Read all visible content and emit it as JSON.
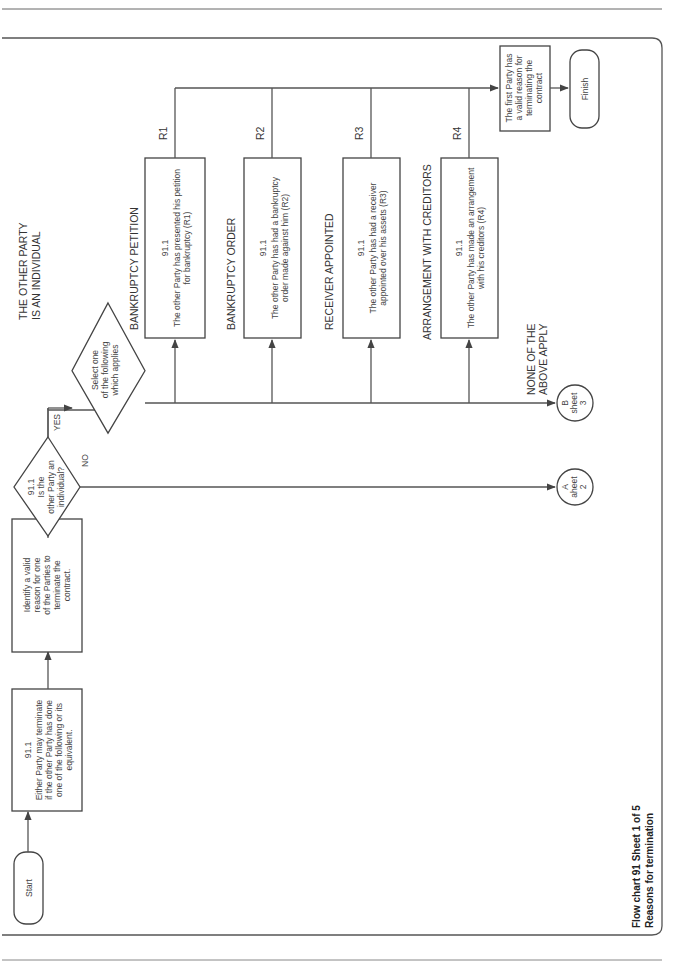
{
  "page": {
    "orientation": "rotated-90-ccw",
    "caption_line1": "Flow chart 91   Sheet 1 of 5",
    "caption_line2": "Reasons for termination"
  },
  "nodes": {
    "start": {
      "label": "Start"
    },
    "either_party": {
      "clause": "91.1",
      "lines": [
        "Either Party may terminate",
        "if the other Party has done",
        "one of the following or its",
        "equivalent."
      ]
    },
    "identify": {
      "lines": [
        "Identify a valid",
        "reason for one",
        "of the Parties to",
        "terminate the",
        "contract."
      ]
    },
    "decision_individual": {
      "lines": [
        "91.1",
        "Is the",
        "other Party an",
        "individual?"
      ],
      "yes_label": "YES",
      "no_label": "NO"
    },
    "section_label": {
      "lines": [
        "THE OTHER PARTY",
        "IS AN INDIVIDUAL"
      ]
    },
    "select": {
      "lines": [
        "Select one",
        "of the following",
        "which applies"
      ]
    },
    "reasons": [
      {
        "code": "R1",
        "heading": "BANKRUPTCY PETITION",
        "clause": "91.1",
        "lines": [
          "The other Party has presented his petition",
          "for bankruptcy (R1)"
        ]
      },
      {
        "code": "R2",
        "heading": "BANKRUPTCY ORDER",
        "clause": "91.1",
        "lines": [
          "The other Party has had a bankruptcy",
          "order made against him (R2)"
        ]
      },
      {
        "code": "R3",
        "heading": "RECEIVER APPOINTED",
        "clause": "91.1",
        "lines": [
          "The other Party has had a receiver",
          "appointed over his assets (R3)"
        ]
      },
      {
        "code": "R4",
        "heading": "ARRANGEMENT WITH CREDITORS",
        "clause": "91.1",
        "lines": [
          "The other Party has made an arrangement",
          "with his creditors (R4)"
        ]
      }
    ],
    "none_apply": {
      "lines": [
        "NONE OF THE",
        "ABOVE APPLY"
      ]
    },
    "connector_b": {
      "lines": [
        "B",
        "sheet",
        "3"
      ]
    },
    "connector_a": {
      "lines": [
        "A",
        "aheet",
        "2"
      ]
    },
    "valid_reason": {
      "lines": [
        "The first Party has",
        "a valid reason for",
        "terminating the",
        "contract"
      ]
    },
    "finish": {
      "label": "Finish"
    }
  }
}
